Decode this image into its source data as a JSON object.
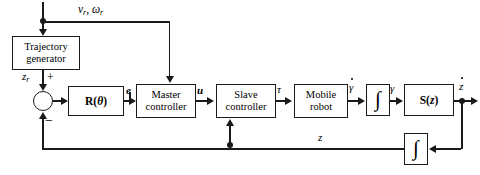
{
  "diagram": {
    "colors": {
      "line": "#1a1a1a",
      "background": "#ffffff",
      "block_fill": "#ffffff"
    },
    "blocks": [
      {
        "id": "trajectory_generator",
        "label_line1": "Trajectory",
        "label_line2": "generator",
        "x": 12,
        "y": 36,
        "w": 68,
        "h": 34
      },
      {
        "id": "rotation_matrix",
        "label_line1": "R(θ)",
        "x": 68,
        "y": 86,
        "w": 56,
        "h": 30
      },
      {
        "id": "master_controller",
        "label_line1": "Master",
        "label_line2": "controller",
        "x": 136,
        "y": 84,
        "w": 60,
        "h": 34
      },
      {
        "id": "slave_controller",
        "label_line1": "Slave",
        "label_line2": "controller",
        "x": 216,
        "y": 84,
        "w": 60,
        "h": 34
      },
      {
        "id": "mobile_robot",
        "label_line1": "Mobile",
        "label_line2": "robot",
        "x": 294,
        "y": 84,
        "w": 54,
        "h": 34
      },
      {
        "id": "integrator_forward",
        "label_line1": "∫",
        "x": 366,
        "y": 84,
        "w": 24,
        "h": 32
      },
      {
        "id": "transfer_sz",
        "label_line1": "S(z)",
        "x": 404,
        "y": 84,
        "w": 50,
        "h": 32
      },
      {
        "id": "integrator_feedback",
        "label_line1": "∫",
        "x": 404,
        "y": 133,
        "w": 24,
        "h": 32
      }
    ],
    "signals": {
      "reference_inputs": "vᵣ, ωᵣ",
      "reference_inputs_base": "v",
      "reference_inputs_sub1": "r",
      "reference_inputs_mid": ", ω",
      "reference_inputs_sub2": "r",
      "trajectory_output_base": "z",
      "trajectory_output_sub": "r",
      "error": "e",
      "master_output": "u",
      "torque": "τ",
      "gamma_dot": "γ",
      "gamma": "γ",
      "z_dot": "z",
      "z_feedback": "z"
    },
    "signs": {
      "positive": "+",
      "negative": "−"
    },
    "junctions": [
      {
        "id": "reference-branch-dot",
        "x": 43,
        "y": 21
      },
      {
        "id": "slave-feedback-tap-dot",
        "x": 228,
        "y": 145
      },
      {
        "id": "output-branch-dot",
        "x": 462,
        "y": 100
      }
    ],
    "summing_junction": {
      "id": "summing-junction",
      "x": 33,
      "y": 91,
      "d": 20
    }
  }
}
